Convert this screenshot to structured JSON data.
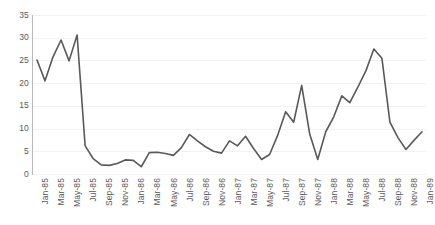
{
  "chart_data": {
    "type": "line",
    "title": "",
    "xlabel": "",
    "ylabel": "",
    "ylim": [
      0,
      35
    ],
    "y_ticks": [
      0,
      5,
      10,
      15,
      20,
      25,
      30,
      35
    ],
    "grid": "horizontal",
    "legend": "none",
    "line_color": "#595959",
    "line_width": 1.6,
    "x_tick_labels": [
      "Jan-85",
      "Mar-85",
      "May-85",
      "Jul-85",
      "Sep-85",
      "Nov-85",
      "Jan-86",
      "Mar-86",
      "May-86",
      "Jul-86",
      "Sep-86",
      "Nov-86",
      "Jan-87",
      "Mar-87",
      "May-87",
      "Jul-87",
      "Sep-87",
      "Nov-87",
      "Jan-88",
      "Mar-88",
      "May-88",
      "Jul-88",
      "Sep-88",
      "Nov-88",
      "Jan-89"
    ],
    "x_tick_every": 2,
    "x": [
      "Jan-85",
      "Feb-85",
      "Mar-85",
      "Apr-85",
      "May-85",
      "Jun-85",
      "Jul-85",
      "Aug-85",
      "Sep-85",
      "Oct-85",
      "Nov-85",
      "Dec-85",
      "Jan-86",
      "Feb-86",
      "Mar-86",
      "Apr-86",
      "May-86",
      "Jun-86",
      "Jul-86",
      "Aug-86",
      "Sep-86",
      "Oct-86",
      "Nov-86",
      "Dec-86",
      "Jan-87",
      "Feb-87",
      "Mar-87",
      "Apr-87",
      "May-87",
      "Jun-87",
      "Jul-87",
      "Aug-87",
      "Sep-87",
      "Oct-87",
      "Nov-87",
      "Dec-87",
      "Jan-88",
      "Feb-88",
      "Mar-88",
      "Apr-88",
      "May-88",
      "Jun-88",
      "Jul-88",
      "Aug-88",
      "Sep-88",
      "Oct-88",
      "Nov-88",
      "Dec-88",
      "Jan-89"
    ],
    "values": [
      25.1,
      20.5,
      25.8,
      29.5,
      24.9,
      30.6,
      6.2,
      3.4,
      2.0,
      1.9,
      2.3,
      3.1,
      3.0,
      1.6,
      4.7,
      4.8,
      4.5,
      4.1,
      5.8,
      8.7,
      7.3,
      6.0,
      5.0,
      4.6,
      7.3,
      6.2,
      8.3,
      5.6,
      3.2,
      4.3,
      8.5,
      13.7,
      11.4,
      19.5,
      8.8,
      3.2,
      9.3,
      12.6,
      17.2,
      15.7,
      19.1,
      22.7,
      27.5,
      25.5,
      11.4,
      8.0,
      5.4,
      7.4,
      9.3
    ]
  }
}
